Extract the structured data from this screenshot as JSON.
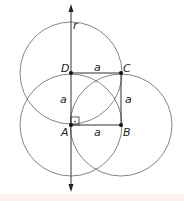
{
  "diagram": {
    "type": "geometric-construction",
    "points": [
      {
        "id": "A",
        "label": "A",
        "x": 71,
        "y": 125
      },
      {
        "id": "B",
        "label": "B",
        "x": 121,
        "y": 125
      },
      {
        "id": "C",
        "label": "C",
        "x": 121,
        "y": 73
      },
      {
        "id": "D",
        "label": "D",
        "x": 71,
        "y": 73
      }
    ],
    "circles": [
      {
        "center": "D",
        "radius": 51
      },
      {
        "center": "A",
        "radius": 51
      },
      {
        "center": "B",
        "radius": 51
      }
    ],
    "line": {
      "label": "r",
      "x": 71,
      "y_top": 6,
      "y_bottom": 190,
      "arrows": "both"
    },
    "sides": [
      {
        "from": "D",
        "to": "C",
        "label": "a"
      },
      {
        "from": "C",
        "to": "B",
        "label": "a"
      },
      {
        "from": "A",
        "to": "B",
        "label": "a"
      },
      {
        "from": "A",
        "to": "D",
        "label": "a"
      }
    ],
    "right_angle_marker_at": "A",
    "colors": {
      "stroke": "#333333",
      "circle": "#555555",
      "text": "#222222",
      "strip": "#fdf0f0"
    }
  },
  "labels": {
    "r": "r",
    "A": "A",
    "B": "B",
    "C": "C",
    "D": "D",
    "side_top": "a",
    "side_right": "a",
    "side_bottom": "a",
    "side_left": "a"
  }
}
